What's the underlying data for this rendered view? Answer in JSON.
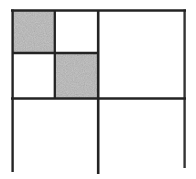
{
  "figure": {
    "colors": {
      "background": "#ffffff",
      "line": "#232323",
      "shaded_fill": "#d4d4d4",
      "open_fill": "#ffffff"
    },
    "shaded_cells": [
      {
        "name": "top-left-shaded-cell",
        "x": 12,
        "y": 10,
        "w": 43,
        "h": 43
      },
      {
        "name": "center-shaded-cell",
        "x": 55,
        "y": 53,
        "w": 43,
        "h": 46
      }
    ],
    "lines": [
      {
        "name": "outer-top-border",
        "x1": 11,
        "y1": 10.5,
        "x2": 186,
        "y2": 10.5,
        "w": 2.6,
        "o": 1
      },
      {
        "name": "outer-left-border",
        "x1": 12.6,
        "y1": 9.5,
        "x2": 12.6,
        "y2": 172,
        "w": 2.4,
        "o": 1
      },
      {
        "name": "outer-right-border",
        "x1": 184.6,
        "y1": 9.5,
        "x2": 184.6,
        "y2": 168,
        "w": 2.4,
        "o": 0.92
      },
      {
        "name": "center-vertical-line",
        "x1": 98.2,
        "y1": 10,
        "x2": 98.2,
        "y2": 174,
        "w": 2.6,
        "o": 1
      },
      {
        "name": "center-horizontal-line",
        "x1": 11,
        "y1": 98.6,
        "x2": 186,
        "y2": 98.6,
        "w": 2.5,
        "o": 1
      },
      {
        "name": "quarter-vertical-line",
        "x1": 54.8,
        "y1": 10,
        "x2": 54.8,
        "y2": 99,
        "w": 2.3,
        "o": 1
      },
      {
        "name": "quarter-horizontal-line",
        "x1": 12,
        "y1": 53,
        "x2": 98,
        "y2": 53,
        "w": 2.3,
        "o": 1
      }
    ]
  }
}
